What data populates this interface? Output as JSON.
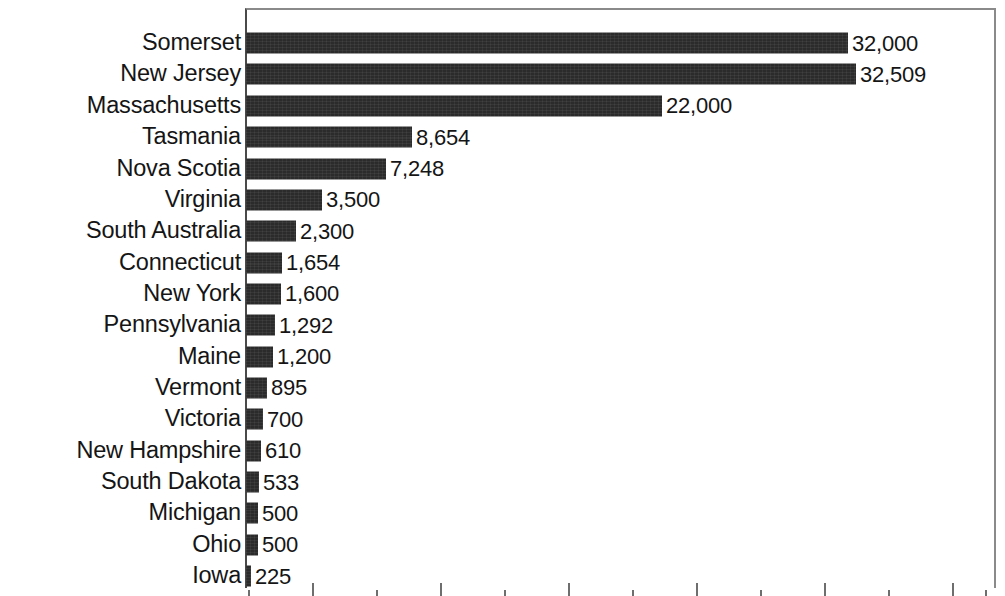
{
  "chart_data": {
    "type": "bar",
    "orientation": "horizontal",
    "title": "",
    "subtitle": "",
    "xlabel": "",
    "ylabel": "",
    "grid": false,
    "legend": false,
    "bar_color": "#2b2b2b",
    "background_color": "#ffffff",
    "text_color": "#151515",
    "axis_color": "#4a4a4a",
    "xlim": [
      0,
      39000
    ],
    "categories": [
      "Somerset",
      "New Jersey",
      "Massachusetts",
      "Tasmania",
      "Nova Scotia",
      "Virginia",
      "South Australia",
      "Connecticut",
      "New York",
      "Pennsylvania",
      "Maine",
      "Vermont",
      "Victoria",
      "New Hampshire",
      "South Dakota",
      "Michigan",
      "Ohio",
      "Iowa"
    ],
    "values": [
      32000,
      32509,
      22000,
      8654,
      7248,
      3500,
      2300,
      1654,
      1600,
      1292,
      1200,
      895,
      700,
      610,
      533,
      500,
      500,
      225
    ],
    "value_labels": [
      "32,000",
      "32,509",
      "22,000",
      "8,654",
      "7,248",
      "3,500",
      "2,300",
      "1,654",
      "1,600",
      "1,292",
      "1,200",
      "895",
      "700",
      "610",
      "533",
      "500",
      "500",
      "225"
    ],
    "bar_pixel_lengths": [
      602,
      610,
      416,
      166,
      140,
      76,
      50,
      36,
      35,
      29,
      27,
      21,
      17,
      15,
      13,
      12,
      12,
      5
    ],
    "axis_ticks": {
      "pattern": "alternating major/minor",
      "major_positions_px": [
        67,
        195,
        323,
        451,
        579,
        707
      ],
      "minor_positions_px": [
        3,
        131,
        259,
        387,
        515,
        643,
        740
      ]
    }
  }
}
